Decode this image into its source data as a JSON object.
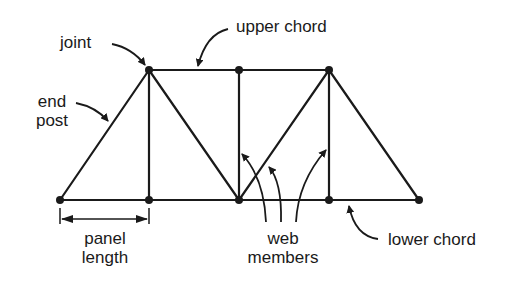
{
  "diagram": {
    "type": "truss",
    "colors": {
      "line": "#1a1a1a",
      "background": "#ffffff"
    },
    "joints": [
      {
        "id": "L0",
        "x": 60,
        "y": 200
      },
      {
        "id": "L1",
        "x": 149,
        "y": 200
      },
      {
        "id": "L2",
        "x": 239,
        "y": 200
      },
      {
        "id": "L3",
        "x": 329,
        "y": 200
      },
      {
        "id": "L4",
        "x": 419,
        "y": 200
      },
      {
        "id": "U1",
        "x": 149,
        "y": 70
      },
      {
        "id": "U2",
        "x": 239,
        "y": 70
      },
      {
        "id": "U3",
        "x": 329,
        "y": 70
      }
    ],
    "members": [
      {
        "from": "L0",
        "to": "L4",
        "kind": "lower chord"
      },
      {
        "from": "U1",
        "to": "U3",
        "kind": "upper chord"
      },
      {
        "from": "L0",
        "to": "U1",
        "kind": "end post"
      },
      {
        "from": "U3",
        "to": "L4",
        "kind": "end post"
      },
      {
        "from": "U1",
        "to": "L1",
        "kind": "web member"
      },
      {
        "from": "U1",
        "to": "L2",
        "kind": "web member"
      },
      {
        "from": "U2",
        "to": "L2",
        "kind": "web member"
      },
      {
        "from": "L2",
        "to": "U3",
        "kind": "web member"
      },
      {
        "from": "U3",
        "to": "L3",
        "kind": "web member"
      }
    ],
    "labels": {
      "joint": "joint",
      "upper_chord": "upper chord",
      "end_post_line1": "end",
      "end_post_line2": "post",
      "panel_length_line1": "panel",
      "panel_length_line2": "length",
      "web_members_line1": "web",
      "web_members_line2": "members",
      "lower_chord": "lower chord"
    }
  }
}
